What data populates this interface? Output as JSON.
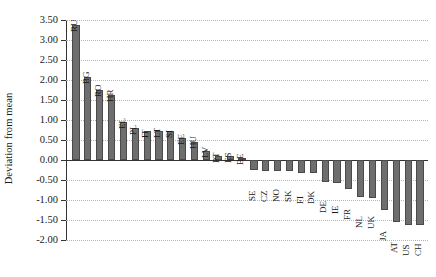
{
  "chart_data": {
    "type": "bar",
    "title": "",
    "xlabel": "",
    "ylabel": "Deviation from mean",
    "ylim": [
      -2.0,
      3.5
    ],
    "ytick_labels": [
      "3.50",
      "3.00",
      "2.50",
      "2.00",
      "1.50",
      "1.00",
      "0.50",
      "0.00",
      "-0.50",
      "-1.00",
      "-1.50",
      "-2.00"
    ],
    "ytick_values": [
      3.5,
      3.0,
      2.5,
      2.0,
      1.5,
      1.0,
      0.5,
      0.0,
      -0.5,
      -1.0,
      -1.5,
      -2.0
    ],
    "grid": true,
    "legend": "none",
    "bar_color": "#6e6e6e",
    "categories": [
      "RU",
      "BG",
      "RO",
      "HR",
      "EL",
      "PL",
      "IT",
      "LT",
      "SI",
      "EE",
      "HU",
      "LV",
      "PT",
      "ES",
      "BE",
      "SE",
      "CZ",
      "NO",
      "SK",
      "FI",
      "DK",
      "DE",
      "IE",
      "FR",
      "NL",
      "UK",
      "JA",
      "AT",
      "US",
      "CH"
    ],
    "values": [
      3.38,
      2.08,
      1.75,
      1.62,
      0.96,
      0.8,
      0.72,
      0.72,
      0.72,
      0.56,
      0.44,
      0.22,
      0.11,
      0.11,
      0.05,
      -0.25,
      -0.27,
      -0.28,
      -0.28,
      -0.33,
      -0.33,
      -0.55,
      -0.58,
      -0.72,
      -0.92,
      -0.96,
      -1.25,
      -1.55,
      -1.62,
      -1.62
    ]
  }
}
